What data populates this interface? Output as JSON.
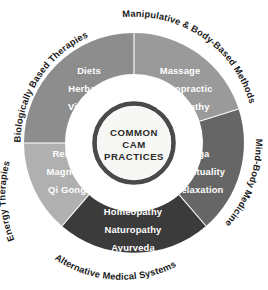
{
  "diagram": {
    "hub": {
      "line1": "COMMON",
      "line2": "CAM",
      "line3": "PRACTICES",
      "fill": "#f7f7f5",
      "ring": "#4a4a4a"
    },
    "background": "#ffffff",
    "segments": [
      {
        "id": "biologically-based-therapies",
        "outer_label": "Biologically Based Therapies",
        "items": [
          "Diets",
          "Herbals",
          "Vitamins"
        ],
        "fill": "#8d8d8d"
      },
      {
        "id": "manipulative-and-body-based-methods",
        "outer_label": "Manipulative & Body-Based Methods",
        "items": [
          "Massage",
          "Chiropractic",
          "Osteopathy"
        ],
        "fill": "#9a9a9a"
      },
      {
        "id": "mind-body-medicine",
        "outer_label": "Mind-Body Medicine",
        "items": [
          "Yoga",
          "Spirituality",
          "Relaxation"
        ],
        "fill": "#666666"
      },
      {
        "id": "alternative-medical-systems",
        "outer_label": "Alternative Medical Systems",
        "items": [
          "Homeopathy",
          "Naturopathy",
          "Ayurveda"
        ],
        "fill": "#3b3b3b"
      },
      {
        "id": "energy-therapies",
        "outer_label": "Energy Therapies",
        "items": [
          "Reiki",
          "Magnets",
          "Qi Gong"
        ],
        "fill": "#b0b0b0"
      }
    ]
  }
}
